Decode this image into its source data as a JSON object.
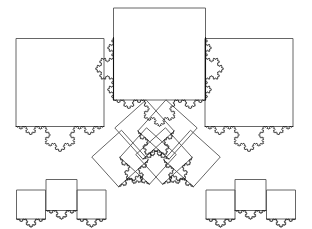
{
  "figure": {
    "type": "geometric-fractal-diagram",
    "canvas": {
      "width": 312,
      "height": 229,
      "background": "#ffffff"
    },
    "colors": {
      "square_stroke": "#555555",
      "koch_stroke": "#111111",
      "base_stroke": "#111111",
      "background": "#ffffff"
    },
    "koch": {
      "iterations": 4,
      "bump_ratio": 0.2886751346,
      "description": "Koch curve of order 4 raised on each marked square edge"
    },
    "squares": [
      {
        "id": "top-left-large",
        "cx": 60.0,
        "cy": 82.5,
        "size": 88.0,
        "angle": 0,
        "koch_edge": "bottom",
        "koch_dir": "up",
        "label": "large left square"
      },
      {
        "id": "top-middle-large",
        "cx": 159.5,
        "cy": 54.0,
        "size": 92.0,
        "angle": 0,
        "koch_edge": "bottom",
        "koch_dir": "up",
        "label": "large middle square"
      },
      {
        "id": "top-right-large",
        "cx": 249.0,
        "cy": 82.5,
        "size": 88.0,
        "angle": 0,
        "koch_edge": "bottom",
        "koch_dir": "up",
        "label": "large right square"
      },
      {
        "id": "mid-left-a",
        "cx": 120.0,
        "cy": 158.5,
        "size": 40.0,
        "angle": -42,
        "koch_edge": "bottom",
        "koch_dir": "up",
        "label": "rotated left outer square"
      },
      {
        "id": "mid-left-b",
        "cx": 144.5,
        "cy": 129.5,
        "size": 42.0,
        "angle": -42,
        "koch_edge": "bottom",
        "koch_dir": "up",
        "label": "rotated left middle square"
      },
      {
        "id": "mid-left-c",
        "cx": 164.0,
        "cy": 156.0,
        "size": 40.0,
        "angle": -42,
        "koch_edge": "bottom",
        "koch_dir": "up",
        "label": "rotated left inner square"
      },
      {
        "id": "mid-right-a",
        "cx": 192.0,
        "cy": 158.5,
        "size": 40.0,
        "angle": 42,
        "koch_edge": "bottom",
        "koch_dir": "up",
        "label": "rotated right inner square"
      },
      {
        "id": "mid-right-b",
        "cx": 167.5,
        "cy": 129.5,
        "size": 42.0,
        "angle": 42,
        "koch_edge": "bottom",
        "koch_dir": "up",
        "label": "rotated right middle square"
      },
      {
        "id": "mid-right-c",
        "cx": 148.0,
        "cy": 156.0,
        "size": 40.0,
        "angle": 42,
        "koch_edge": "bottom",
        "koch_dir": "up",
        "label": "rotated right outer square"
      },
      {
        "id": "bot-l-1",
        "cx": 31.0,
        "cy": 204.5,
        "size": 29.0,
        "angle": 0,
        "koch_edge": "bottom",
        "koch_dir": "up",
        "label": "small square bottom row 1"
      },
      {
        "id": "bot-l-2",
        "cx": 61.5,
        "cy": 195.0,
        "size": 31.0,
        "angle": 0,
        "koch_edge": "bottom",
        "koch_dir": "up",
        "label": "small square bottom row 2"
      },
      {
        "id": "bot-l-3",
        "cx": 91.5,
        "cy": 204.5,
        "size": 29.0,
        "angle": 0,
        "koch_edge": "bottom",
        "koch_dir": "up",
        "label": "small square bottom row 3"
      },
      {
        "id": "bot-r-1",
        "cx": 220.5,
        "cy": 204.5,
        "size": 29.0,
        "angle": 0,
        "koch_edge": "bottom",
        "koch_dir": "up",
        "label": "small square bottom row 4"
      },
      {
        "id": "bot-r-2",
        "cx": 250.5,
        "cy": 195.0,
        "size": 31.0,
        "angle": 0,
        "koch_edge": "bottom",
        "koch_dir": "up",
        "label": "small square bottom row 5"
      },
      {
        "id": "bot-r-3",
        "cx": 281.0,
        "cy": 204.5,
        "size": 29.0,
        "angle": 0,
        "koch_edge": "bottom",
        "koch_dir": "up",
        "label": "small square bottom row 6"
      }
    ],
    "vertical_koch": [
      {
        "id": "mid-left-edge",
        "x1": 113.5,
        "y1": 100.0,
        "x2": 113.5,
        "y2": 37.5,
        "dir": "right",
        "label": "middle square left edge koch"
      },
      {
        "id": "mid-right-edge",
        "x1": 205.5,
        "y1": 37.5,
        "x2": 205.5,
        "y2": 100.0,
        "dir": "right",
        "label": "middle square right edge koch"
      }
    ],
    "base_segments": [
      {
        "id": "mid-left-base",
        "x1": 113.5,
        "y1": 37.5,
        "x2": 113.5,
        "y2": 100.0,
        "label": "middle square left edge"
      },
      {
        "id": "mid-right-base",
        "x1": 205.5,
        "y1": 37.5,
        "x2": 205.5,
        "y2": 100.0,
        "label": "middle square right edge"
      }
    ]
  }
}
